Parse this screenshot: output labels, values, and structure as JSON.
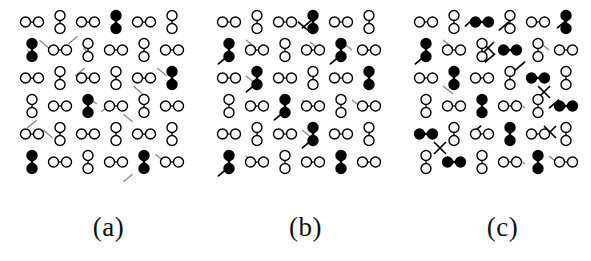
{
  "figure": {
    "background_color": "#ffffff",
    "ink_color": "#000000",
    "faint_ink_color": "#8a8a8a",
    "panel_width": 197,
    "panel_height": 205
  },
  "panels": [
    {
      "id": "a",
      "label": "(a)",
      "origin_x": 10,
      "cell": 28,
      "x0": 22,
      "y0": 22,
      "open_dimer_count": 28,
      "filled_dimer_count": 6,
      "tick_count": 14,
      "cross_count": 0,
      "dimers": [
        {
          "c": 0,
          "r": 0,
          "o": "h",
          "f": false
        },
        {
          "c": 1,
          "r": 0,
          "o": "v",
          "f": false
        },
        {
          "c": 2,
          "r": 0,
          "o": "h",
          "f": false
        },
        {
          "c": 3,
          "r": 0,
          "o": "v",
          "f": true
        },
        {
          "c": 4,
          "r": 0,
          "o": "h",
          "f": false
        },
        {
          "c": 5,
          "r": 0,
          "o": "v",
          "f": false
        },
        {
          "c": 0,
          "r": 1,
          "o": "v",
          "f": true
        },
        {
          "c": 1,
          "r": 1,
          "o": "h",
          "f": false
        },
        {
          "c": 2,
          "r": 1,
          "o": "v",
          "f": false
        },
        {
          "c": 3,
          "r": 1,
          "o": "h",
          "f": false
        },
        {
          "c": 4,
          "r": 1,
          "o": "v",
          "f": false
        },
        {
          "c": 5,
          "r": 1,
          "o": "h",
          "f": false
        },
        {
          "c": 0,
          "r": 2,
          "o": "h",
          "f": false
        },
        {
          "c": 1,
          "r": 2,
          "o": "v",
          "f": false
        },
        {
          "c": 2,
          "r": 2,
          "o": "h",
          "f": false
        },
        {
          "c": 3,
          "r": 2,
          "o": "v",
          "f": false
        },
        {
          "c": 4,
          "r": 2,
          "o": "h",
          "f": false
        },
        {
          "c": 5,
          "r": 2,
          "o": "v",
          "f": true
        },
        {
          "c": 0,
          "r": 3,
          "o": "v",
          "f": false
        },
        {
          "c": 1,
          "r": 3,
          "o": "h",
          "f": false
        },
        {
          "c": 2,
          "r": 3,
          "o": "v",
          "f": true
        },
        {
          "c": 3,
          "r": 3,
          "o": "h",
          "f": false
        },
        {
          "c": 4,
          "r": 3,
          "o": "v",
          "f": false
        },
        {
          "c": 5,
          "r": 3,
          "o": "h",
          "f": false
        },
        {
          "c": 0,
          "r": 4,
          "o": "h",
          "f": false
        },
        {
          "c": 1,
          "r": 4,
          "o": "v",
          "f": false
        },
        {
          "c": 2,
          "r": 4,
          "o": "h",
          "f": false
        },
        {
          "c": 3,
          "r": 4,
          "o": "v",
          "f": false
        },
        {
          "c": 4,
          "r": 4,
          "o": "h",
          "f": false
        },
        {
          "c": 5,
          "r": 4,
          "o": "v",
          "f": false
        },
        {
          "c": 0,
          "r": 5,
          "o": "v",
          "f": true
        },
        {
          "c": 1,
          "r": 5,
          "o": "h",
          "f": false
        },
        {
          "c": 2,
          "r": 5,
          "o": "v",
          "f": false
        },
        {
          "c": 3,
          "r": 5,
          "o": "h",
          "f": false
        },
        {
          "c": 4,
          "r": 5,
          "o": "v",
          "f": true
        },
        {
          "c": 5,
          "r": 5,
          "o": "h",
          "f": false
        }
      ],
      "ticks": [
        {
          "x": 34,
          "y": 44,
          "a": 40,
          "len": 11,
          "faint": true
        },
        {
          "x": 22,
          "y": 54,
          "a": 40,
          "len": 11,
          "faint": true
        },
        {
          "x": 63,
          "y": 40,
          "a": -40,
          "len": 11,
          "faint": true
        },
        {
          "x": 78,
          "y": 52,
          "a": 40,
          "len": 11,
          "faint": true
        },
        {
          "x": 70,
          "y": 72,
          "a": -40,
          "len": 11,
          "faint": true
        },
        {
          "x": 152,
          "y": 72,
          "a": 40,
          "len": 11,
          "faint": true
        },
        {
          "x": 128,
          "y": 90,
          "a": 40,
          "len": 11,
          "faint": true
        },
        {
          "x": 82,
          "y": 100,
          "a": 40,
          "len": 11,
          "faint": true
        },
        {
          "x": 96,
          "y": 108,
          "a": -40,
          "len": 11,
          "faint": true
        },
        {
          "x": 22,
          "y": 124,
          "a": -40,
          "len": 11,
          "faint": true
        },
        {
          "x": 38,
          "y": 134,
          "a": 40,
          "len": 11,
          "faint": true
        },
        {
          "x": 118,
          "y": 118,
          "a": 40,
          "len": 11,
          "faint": true
        },
        {
          "x": 150,
          "y": 158,
          "a": 40,
          "len": 11,
          "faint": true
        },
        {
          "x": 118,
          "y": 178,
          "a": -40,
          "len": 11,
          "faint": true
        }
      ],
      "crosses": []
    },
    {
      "id": "b",
      "label": "(b)",
      "origin_x": 207,
      "cell": 28,
      "x0": 22,
      "y0": 22,
      "open_dimer_count": 25,
      "filled_dimer_count": 9,
      "tick_count": 16,
      "cross_count": 0,
      "dimers": [
        {
          "c": 0,
          "r": 0,
          "o": "h",
          "f": false
        },
        {
          "c": 1,
          "r": 0,
          "o": "v",
          "f": false
        },
        {
          "c": 2,
          "r": 0,
          "o": "h",
          "f": false
        },
        {
          "c": 3,
          "r": 0,
          "o": "v",
          "f": true
        },
        {
          "c": 4,
          "r": 0,
          "o": "h",
          "f": false
        },
        {
          "c": 5,
          "r": 0,
          "o": "v",
          "f": false
        },
        {
          "c": 0,
          "r": 1,
          "o": "v",
          "f": true
        },
        {
          "c": 1,
          "r": 1,
          "o": "h",
          "f": false
        },
        {
          "c": 2,
          "r": 1,
          "o": "v",
          "f": false
        },
        {
          "c": 3,
          "r": 1,
          "o": "h",
          "f": false
        },
        {
          "c": 4,
          "r": 1,
          "o": "v",
          "f": true
        },
        {
          "c": 5,
          "r": 1,
          "o": "h",
          "f": false
        },
        {
          "c": 0,
          "r": 2,
          "o": "h",
          "f": false
        },
        {
          "c": 1,
          "r": 2,
          "o": "v",
          "f": true
        },
        {
          "c": 2,
          "r": 2,
          "o": "h",
          "f": false
        },
        {
          "c": 3,
          "r": 2,
          "o": "v",
          "f": false
        },
        {
          "c": 4,
          "r": 2,
          "o": "h",
          "f": false
        },
        {
          "c": 5,
          "r": 2,
          "o": "v",
          "f": true
        },
        {
          "c": 0,
          "r": 3,
          "o": "v",
          "f": false
        },
        {
          "c": 1,
          "r": 3,
          "o": "h",
          "f": false
        },
        {
          "c": 2,
          "r": 3,
          "o": "v",
          "f": true
        },
        {
          "c": 3,
          "r": 3,
          "o": "h",
          "f": false
        },
        {
          "c": 4,
          "r": 3,
          "o": "v",
          "f": false
        },
        {
          "c": 5,
          "r": 3,
          "o": "h",
          "f": false
        },
        {
          "c": 0,
          "r": 4,
          "o": "h",
          "f": false
        },
        {
          "c": 1,
          "r": 4,
          "o": "v",
          "f": false
        },
        {
          "c": 2,
          "r": 4,
          "o": "h",
          "f": false
        },
        {
          "c": 3,
          "r": 4,
          "o": "v",
          "f": true
        },
        {
          "c": 4,
          "r": 4,
          "o": "h",
          "f": false
        },
        {
          "c": 5,
          "r": 4,
          "o": "v",
          "f": false
        },
        {
          "c": 0,
          "r": 5,
          "o": "v",
          "f": true
        },
        {
          "c": 1,
          "r": 5,
          "o": "h",
          "f": false
        },
        {
          "c": 2,
          "r": 5,
          "o": "v",
          "f": false
        },
        {
          "c": 3,
          "r": 5,
          "o": "h",
          "f": false
        },
        {
          "c": 4,
          "r": 5,
          "o": "v",
          "f": true
        },
        {
          "c": 5,
          "r": 5,
          "o": "h",
          "f": false
        }
      ],
      "ticks": [
        {
          "x": 100,
          "y": 24,
          "a": -40,
          "len": 12,
          "faint": false
        },
        {
          "x": 96,
          "y": 26,
          "a": 40,
          "len": 12,
          "faint": false
        },
        {
          "x": 44,
          "y": 44,
          "a": 40,
          "len": 12,
          "faint": true
        },
        {
          "x": 108,
          "y": 46,
          "a": 40,
          "len": 12,
          "faint": true
        },
        {
          "x": 140,
          "y": 46,
          "a": 40,
          "len": 12,
          "faint": true
        },
        {
          "x": 16,
          "y": 60,
          "a": -40,
          "len": 12,
          "faint": false
        },
        {
          "x": 128,
          "y": 60,
          "a": -40,
          "len": 12,
          "faint": false
        },
        {
          "x": 44,
          "y": 80,
          "a": 40,
          "len": 12,
          "faint": true
        },
        {
          "x": 44,
          "y": 88,
          "a": -40,
          "len": 12,
          "faint": false
        },
        {
          "x": 100,
          "y": 104,
          "a": 40,
          "len": 12,
          "faint": true
        },
        {
          "x": 150,
          "y": 104,
          "a": 40,
          "len": 12,
          "faint": true
        },
        {
          "x": 72,
          "y": 116,
          "a": -40,
          "len": 12,
          "faint": false
        },
        {
          "x": 100,
          "y": 134,
          "a": 40,
          "len": 12,
          "faint": true
        },
        {
          "x": 100,
          "y": 144,
          "a": -40,
          "len": 12,
          "faint": false
        },
        {
          "x": 44,
          "y": 160,
          "a": 40,
          "len": 12,
          "faint": true
        },
        {
          "x": 16,
          "y": 172,
          "a": -40,
          "len": 12,
          "faint": false
        }
      ],
      "crosses": []
    },
    {
      "id": "c",
      "label": "(c)",
      "origin_x": 404,
      "cell": 28,
      "x0": 22,
      "y0": 22,
      "open_dimer_count": 22,
      "filled_dimer_count": 12,
      "tick_count": 14,
      "cross_count": 4,
      "dimers": [
        {
          "c": 0,
          "r": 0,
          "o": "h",
          "f": false
        },
        {
          "c": 1,
          "r": 0,
          "o": "v",
          "f": false
        },
        {
          "c": 2,
          "r": 0,
          "o": "h",
          "f": true
        },
        {
          "c": 3,
          "r": 0,
          "o": "v",
          "f": false
        },
        {
          "c": 4,
          "r": 0,
          "o": "h",
          "f": false
        },
        {
          "c": 5,
          "r": 0,
          "o": "v",
          "f": true
        },
        {
          "c": 0,
          "r": 1,
          "o": "v",
          "f": true
        },
        {
          "c": 1,
          "r": 1,
          "o": "h",
          "f": false
        },
        {
          "c": 2,
          "r": 1,
          "o": "v",
          "f": false
        },
        {
          "c": 3,
          "r": 1,
          "o": "h",
          "f": true
        },
        {
          "c": 4,
          "r": 1,
          "o": "v",
          "f": false
        },
        {
          "c": 5,
          "r": 1,
          "o": "h",
          "f": false
        },
        {
          "c": 0,
          "r": 2,
          "o": "h",
          "f": false
        },
        {
          "c": 1,
          "r": 2,
          "o": "v",
          "f": true
        },
        {
          "c": 2,
          "r": 2,
          "o": "h",
          "f": false
        },
        {
          "c": 3,
          "r": 2,
          "o": "v",
          "f": false
        },
        {
          "c": 4,
          "r": 2,
          "o": "h",
          "f": true
        },
        {
          "c": 5,
          "r": 2,
          "o": "v",
          "f": false
        },
        {
          "c": 0,
          "r": 3,
          "o": "v",
          "f": false
        },
        {
          "c": 1,
          "r": 3,
          "o": "h",
          "f": false
        },
        {
          "c": 2,
          "r": 3,
          "o": "v",
          "f": true
        },
        {
          "c": 3,
          "r": 3,
          "o": "h",
          "f": false
        },
        {
          "c": 4,
          "r": 3,
          "o": "v",
          "f": false
        },
        {
          "c": 5,
          "r": 3,
          "o": "h",
          "f": true
        },
        {
          "c": 0,
          "r": 4,
          "o": "h",
          "f": true
        },
        {
          "c": 1,
          "r": 4,
          "o": "v",
          "f": false
        },
        {
          "c": 2,
          "r": 4,
          "o": "h",
          "f": false
        },
        {
          "c": 3,
          "r": 4,
          "o": "v",
          "f": true
        },
        {
          "c": 4,
          "r": 4,
          "o": "h",
          "f": false
        },
        {
          "c": 5,
          "r": 4,
          "o": "v",
          "f": false
        },
        {
          "c": 0,
          "r": 5,
          "o": "v",
          "f": false
        },
        {
          "c": 1,
          "r": 5,
          "o": "h",
          "f": true
        },
        {
          "c": 2,
          "r": 5,
          "o": "v",
          "f": false
        },
        {
          "c": 3,
          "r": 5,
          "o": "h",
          "f": false
        },
        {
          "c": 4,
          "r": 5,
          "o": "v",
          "f": true
        },
        {
          "c": 5,
          "r": 5,
          "o": "h",
          "f": false
        }
      ],
      "ticks": [
        {
          "x": 66,
          "y": 22,
          "a": -40,
          "len": 12,
          "faint": false
        },
        {
          "x": 100,
          "y": 26,
          "a": -40,
          "len": 12,
          "faint": false
        },
        {
          "x": 158,
          "y": 24,
          "a": -40,
          "len": 12,
          "faint": false
        },
        {
          "x": 44,
          "y": 44,
          "a": 40,
          "len": 12,
          "faint": true
        },
        {
          "x": 140,
          "y": 46,
          "a": 40,
          "len": 12,
          "faint": true
        },
        {
          "x": 16,
          "y": 60,
          "a": -40,
          "len": 12,
          "faint": false
        },
        {
          "x": 86,
          "y": 58,
          "a": -40,
          "len": 12,
          "faint": false
        },
        {
          "x": 116,
          "y": 66,
          "a": -40,
          "len": 12,
          "faint": false
        },
        {
          "x": 44,
          "y": 90,
          "a": 40,
          "len": 12,
          "faint": true
        },
        {
          "x": 116,
          "y": 104,
          "a": 40,
          "len": 12,
          "faint": true
        },
        {
          "x": 150,
          "y": 104,
          "a": -40,
          "len": 12,
          "faint": false
        },
        {
          "x": 72,
          "y": 130,
          "a": -40,
          "len": 12,
          "faint": false
        },
        {
          "x": 116,
          "y": 160,
          "a": 40,
          "len": 12,
          "faint": true
        },
        {
          "x": 150,
          "y": 160,
          "a": 40,
          "len": 12,
          "faint": true
        }
      ],
      "crosses": [
        {
          "x": 84,
          "y": 48,
          "len": 11
        },
        {
          "x": 140,
          "y": 92,
          "len": 11
        },
        {
          "x": 36,
          "y": 148,
          "len": 11
        },
        {
          "x": 146,
          "y": 132,
          "len": 11
        }
      ]
    }
  ],
  "captions": {
    "a": "(a)",
    "b": "(b)",
    "c": "(c)"
  }
}
